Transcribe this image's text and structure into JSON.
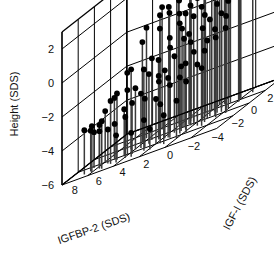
{
  "chart_data": {
    "type": "scatter",
    "title": "",
    "projection": "3d",
    "xlabel": "IGFBP-2 (SDS)",
    "ylabel": "IGF-I (SDS)",
    "zlabel": "Height (SDS)",
    "xticks": [
      8,
      6,
      4,
      2,
      0,
      -2,
      -4
    ],
    "yticks": [
      -2,
      0,
      2,
      4
    ],
    "zticks": [
      2,
      0,
      -2,
      -4,
      -6
    ],
    "xlim": [
      -4,
      9
    ],
    "ylim": [
      -3,
      5
    ],
    "zlim": [
      -6,
      3
    ],
    "grid": true,
    "legend": null,
    "marker": "filled-square-dot",
    "marker_color": "#000000",
    "stem_color": "#3a3a3a",
    "stems_to": -6,
    "box_color": "#000000",
    "points": [
      {
        "x": 7.6,
        "y": -2.3,
        "z": -3.4
      },
      {
        "x": 7.2,
        "y": -2.1,
        "z": -3.6
      },
      {
        "x": 6.9,
        "y": -2.4,
        "z": -3.3
      },
      {
        "x": 6.6,
        "y": -1.9,
        "z": -3.5
      },
      {
        "x": 6.4,
        "y": -2.2,
        "z": -3.8
      },
      {
        "x": 6.1,
        "y": -1.6,
        "z": -4.0
      },
      {
        "x": 6.0,
        "y": -2.5,
        "z": -3.2
      },
      {
        "x": 5.8,
        "y": -1.2,
        "z": -3.9
      },
      {
        "x": 5.6,
        "y": -2.0,
        "z": -2.3
      },
      {
        "x": 5.4,
        "y": -1.5,
        "z": -2.1
      },
      {
        "x": 5.2,
        "y": -0.9,
        "z": -3.3
      },
      {
        "x": 5.0,
        "y": -2.2,
        "z": -4.4
      },
      {
        "x": 4.8,
        "y": -1.1,
        "z": -2.2
      },
      {
        "x": 4.6,
        "y": -0.4,
        "z": -2.4
      },
      {
        "x": 4.5,
        "y": -1.8,
        "z": -3.6
      },
      {
        "x": 4.3,
        "y": 0.2,
        "z": -1.6
      },
      {
        "x": 4.2,
        "y": -1.4,
        "z": -3.0
      },
      {
        "x": 4.0,
        "y": -0.6,
        "z": -2.8
      },
      {
        "x": 3.9,
        "y": 0.6,
        "z": -1.2
      },
      {
        "x": 3.8,
        "y": -2.1,
        "z": -4.6
      },
      {
        "x": 3.6,
        "y": -0.2,
        "z": -1.9
      },
      {
        "x": 3.5,
        "y": 1.0,
        "z": 0.3
      },
      {
        "x": 3.4,
        "y": -1.0,
        "z": -3.1
      },
      {
        "x": 3.2,
        "y": 0.4,
        "z": -1.4
      },
      {
        "x": 3.1,
        "y": 1.6,
        "z": 0.9
      },
      {
        "x": 3.0,
        "y": -1.7,
        "z": -4.2
      },
      {
        "x": 2.9,
        "y": 0.0,
        "z": -2.6
      },
      {
        "x": 2.8,
        "y": 1.2,
        "z": -0.5
      },
      {
        "x": 2.7,
        "y": 2.2,
        "z": 1.3
      },
      {
        "x": 2.6,
        "y": -0.8,
        "z": -3.4
      },
      {
        "x": 2.5,
        "y": 0.8,
        "z": -1.0
      },
      {
        "x": 2.4,
        "y": 1.8,
        "z": 0.6
      },
      {
        "x": 2.3,
        "y": -2.0,
        "z": -4.8
      },
      {
        "x": 2.2,
        "y": -0.3,
        "z": -2.0
      },
      {
        "x": 2.1,
        "y": 1.4,
        "z": 0.1
      },
      {
        "x": 2.0,
        "y": 2.6,
        "z": 1.5
      },
      {
        "x": 1.9,
        "y": -1.3,
        "z": -3.7
      },
      {
        "x": 1.8,
        "y": 0.3,
        "z": -1.5
      },
      {
        "x": 1.7,
        "y": 1.1,
        "z": -0.2
      },
      {
        "x": 1.6,
        "y": 2.0,
        "z": 0.8
      },
      {
        "x": 1.5,
        "y": -0.7,
        "z": -2.9
      },
      {
        "x": 1.4,
        "y": 0.9,
        "z": -0.8
      },
      {
        "x": 1.3,
        "y": 2.4,
        "z": 1.0
      },
      {
        "x": 1.2,
        "y": -1.9,
        "z": -4.3
      },
      {
        "x": 1.1,
        "y": 0.1,
        "z": -2.2
      },
      {
        "x": 1.0,
        "y": 1.5,
        "z": 0.2
      },
      {
        "x": 0.9,
        "y": 2.8,
        "z": 1.2
      },
      {
        "x": 0.8,
        "y": -0.5,
        "z": -2.7
      },
      {
        "x": 0.7,
        "y": 0.7,
        "z": -1.1
      },
      {
        "x": 0.6,
        "y": 1.9,
        "z": 0.5
      },
      {
        "x": 0.5,
        "y": 3.0,
        "z": 1.4
      },
      {
        "x": 0.4,
        "y": -1.5,
        "z": -3.8
      },
      {
        "x": 0.3,
        "y": 0.5,
        "z": -1.7
      },
      {
        "x": 0.2,
        "y": 1.7,
        "z": 0.0
      },
      {
        "x": 0.1,
        "y": 2.9,
        "z": 1.1
      },
      {
        "x": 0.0,
        "y": -0.9,
        "z": -3.0
      },
      {
        "x": -0.1,
        "y": 1.0,
        "z": -0.6
      },
      {
        "x": -0.2,
        "y": 2.3,
        "z": 0.7
      },
      {
        "x": -0.3,
        "y": 3.4,
        "z": 1.6
      },
      {
        "x": -0.4,
        "y": -0.1,
        "z": -2.4
      },
      {
        "x": -0.5,
        "y": 1.3,
        "z": -0.3
      },
      {
        "x": -0.6,
        "y": 2.6,
        "z": 0.9
      },
      {
        "x": -0.8,
        "y": 0.2,
        "z": -1.8
      },
      {
        "x": -0.9,
        "y": 1.6,
        "z": 0.4
      },
      {
        "x": -1.0,
        "y": 3.1,
        "z": 1.3
      },
      {
        "x": -1.1,
        "y": -0.6,
        "z": -2.6
      },
      {
        "x": -1.2,
        "y": 0.9,
        "z": -0.9
      },
      {
        "x": -1.3,
        "y": 2.1,
        "z": 0.6
      },
      {
        "x": -1.5,
        "y": 3.6,
        "z": 1.8
      },
      {
        "x": -1.6,
        "y": 0.4,
        "z": -1.3
      },
      {
        "x": -1.7,
        "y": 1.8,
        "z": 0.3
      },
      {
        "x": -1.8,
        "y": 3.2,
        "z": 1.5
      },
      {
        "x": -2.0,
        "y": 1.1,
        "z": -0.4
      },
      {
        "x": -2.1,
        "y": 2.5,
        "z": 1.0
      },
      {
        "x": -2.3,
        "y": 0.6,
        "z": -1.0
      },
      {
        "x": -2.4,
        "y": 3.8,
        "z": 2.4
      },
      {
        "x": 4.9,
        "y": 0.9,
        "z": -0.1
      },
      {
        "x": 5.3,
        "y": 0.1,
        "z": -1.3
      },
      {
        "x": 3.3,
        "y": 2.8,
        "z": 1.7
      },
      {
        "x": 2.45,
        "y": 3.3,
        "z": 1.9
      },
      {
        "x": 1.45,
        "y": 3.5,
        "z": 1.6
      },
      {
        "x": 0.45,
        "y": 3.9,
        "z": 2.0
      },
      {
        "x": 6.3,
        "y": -0.5,
        "z": -2.5
      },
      {
        "x": 5.9,
        "y": 0.5,
        "z": -1.5
      },
      {
        "x": 4.1,
        "y": 1.9,
        "z": 0.9
      },
      {
        "x": 3.7,
        "y": 2.4,
        "z": 1.1
      },
      {
        "x": 2.15,
        "y": 2.2,
        "z": 0.4
      },
      {
        "x": 1.25,
        "y": 1.3,
        "z": -0.7
      },
      {
        "x": 0.65,
        "y": 0.0,
        "z": -2.1
      },
      {
        "x": -0.75,
        "y": 2.9,
        "z": 1.2
      },
      {
        "x": -1.4,
        "y": 1.4,
        "z": -0.2
      },
      {
        "x": 6.8,
        "y": -0.9,
        "z": -3.0
      },
      {
        "x": 7.4,
        "y": -1.4,
        "z": -3.9
      },
      {
        "x": 5.1,
        "y": 1.7,
        "z": 0.5
      },
      {
        "x": 4.4,
        "y": 2.6,
        "z": 1.2
      },
      {
        "x": 2.75,
        "y": 3.6,
        "z": 1.8
      },
      {
        "x": 0.15,
        "y": 3.2,
        "z": 1.4
      },
      {
        "x": -0.55,
        "y": 0.9,
        "z": -1.4
      },
      {
        "x": -1.95,
        "y": 2.8,
        "z": 1.1
      },
      {
        "x": 3.05,
        "y": 0.2,
        "z": -2.3
      },
      {
        "x": 1.85,
        "y": -0.4,
        "z": -2.5
      }
    ]
  },
  "axes": {
    "x_title": "IGFBP-2 (SDS)",
    "y_title": "IGF-I (SDS)",
    "z_title": "Height (SDS)",
    "x_tick_labels": [
      "8",
      "6",
      "4",
      "2",
      "0",
      "-2",
      "-4"
    ],
    "y_tick_labels": [
      "-2",
      "0",
      "2",
      "4"
    ],
    "z_tick_labels": [
      "2",
      "0",
      "-2",
      "-4",
      "-6"
    ]
  }
}
